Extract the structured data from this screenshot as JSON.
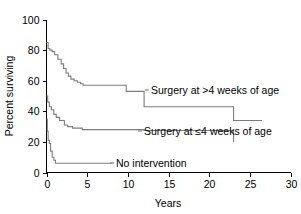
{
  "chart_data": {
    "type": "line",
    "subtype": "kaplan-meier-step",
    "title": "",
    "xlabel": "Years",
    "ylabel": "Percent surviving",
    "xlim": [
      0,
      30
    ],
    "ylim": [
      0,
      100
    ],
    "xticks": [
      "0",
      "5",
      "10",
      "15",
      "20",
      "25",
      "30"
    ],
    "xtick_values": [
      0,
      5,
      10,
      15,
      20,
      25,
      30
    ],
    "yticks": [
      "0",
      "20",
      "40",
      "60",
      "80",
      "100"
    ],
    "ytick_values": [
      0,
      20,
      40,
      60,
      80,
      100
    ],
    "grid": false,
    "legend_position": "inline-annotations",
    "line_color": "#7d7d7d",
    "axis_color": "#000000",
    "background": "#ffffff",
    "series": [
      {
        "name": "Surgery at >4 weeks of age",
        "label": "Surgery at >4 weeks of age",
        "x": [
          0,
          0.2,
          0.4,
          0.7,
          1.0,
          1.4,
          1.8,
          2.1,
          2.4,
          2.7,
          3.0,
          3.4,
          3.8,
          4.2,
          4.5,
          9.8,
          12.0,
          23.0,
          26.5
        ],
        "y": [
          85,
          81,
          80,
          79,
          77,
          74,
          71,
          68,
          65,
          63,
          61,
          60,
          59,
          58,
          57,
          53,
          43,
          34,
          34
        ]
      },
      {
        "name": "Surgery at <=4 weeks of age",
        "label": "Surgery at ≤4 weeks of age",
        "x": [
          0,
          0.15,
          0.35,
          0.6,
          0.9,
          1.2,
          1.6,
          2.2,
          2.6,
          3.2,
          4.4,
          12.0,
          23.0
        ],
        "y": [
          50,
          46,
          43,
          41,
          38,
          36,
          34,
          31,
          30,
          29,
          28,
          27.5,
          20
        ]
      },
      {
        "name": "No intervention",
        "label": "No intervention",
        "x": [
          0,
          0.1,
          0.2,
          0.35,
          0.5,
          0.7,
          0.9,
          1.1,
          8.0
        ],
        "y": [
          35,
          27,
          21,
          19,
          14,
          10,
          8,
          6,
          6
        ]
      }
    ],
    "annotations": [
      {
        "text": "Surgery at >4 weeks of age",
        "series": "Surgery at >4 weeks of age"
      },
      {
        "text": "Surgery at ≤4 weeks of age",
        "series": "Surgery at <=4 weeks of age"
      },
      {
        "text": "No intervention",
        "series": "No intervention"
      }
    ]
  }
}
